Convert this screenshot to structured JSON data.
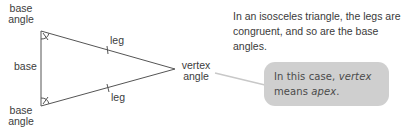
{
  "diagram": {
    "title": "Isosceles triangle",
    "labels": {
      "base_angle_top": [
        "base",
        "angle"
      ],
      "base_angle_bottom": [
        "base",
        "angle"
      ],
      "base": "base",
      "leg_top": "leg",
      "leg_bottom": "leg",
      "vertex_angle": [
        "vertex",
        "angle"
      ]
    },
    "colors": {
      "stroke": "#555555",
      "connector": "#c8c8c8",
      "callout_bg": "#cfcfcf",
      "text": "#3a3a3a"
    }
  },
  "caption": {
    "text": "In an isosceles triangle, the legs are congruent, and so are the base angles."
  },
  "callout": {
    "prefix": "In this case, ",
    "em1": "vertex",
    "middle": " means ",
    "em2": "apex",
    "suffix": "."
  }
}
